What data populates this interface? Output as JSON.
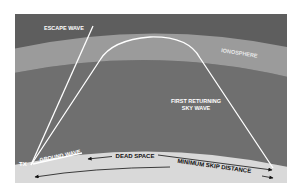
{
  "diagram": {
    "labels": {
      "escape_wave": "ESCAPE WAVE",
      "ionosphere": "IONOSPHERE",
      "sky_wave_line1": "FIRST RETURNING",
      "sky_wave_line2": "SKY WAVE",
      "tx": "TX",
      "ground_wave": "GROUND WAVE",
      "dead_space": "DEAD SPACE",
      "min_skip": "MINIMUM SKIP DISTANCE"
    },
    "colors": {
      "page": "#ffffff",
      "upper_sky": "#5e5e5e",
      "ionosphere": "#9b9b9b",
      "lower_sky": "#6f6f6f",
      "ground": "#d9d9d9",
      "wave": "#ffffff",
      "ground_text": "#111111"
    }
  }
}
